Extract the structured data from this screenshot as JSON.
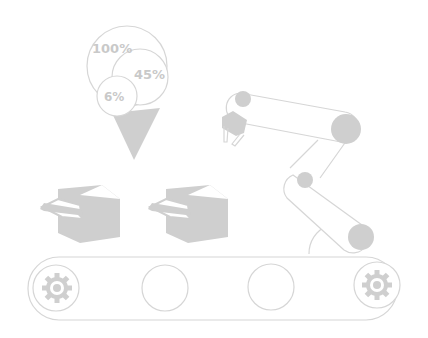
{
  "illustration": {
    "description": "Robotic arm over conveyor belt with boxes and percentage bubbles",
    "colors": {
      "background": "#ffffff",
      "fill": "#cfcfcf",
      "stroke": "#d6d6d6",
      "text": "#c9c9c9"
    },
    "bubbles": [
      {
        "label": "100%"
      },
      {
        "label": "45%"
      },
      {
        "label": "6%"
      }
    ],
    "boxes": [
      {
        "name": "box-1"
      },
      {
        "name": "box-2"
      }
    ],
    "conveyor": {
      "gears": 2,
      "rollers": 2
    }
  }
}
